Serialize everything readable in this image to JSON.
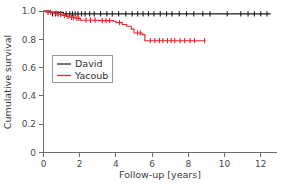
{
  "chart_data": {
    "type": "line",
    "subtype": "kaplan-meier-step",
    "title": "",
    "xlabel": "Follow-up [years]",
    "ylabel": "Cumulative survival",
    "xlim": [
      0,
      12.9
    ],
    "ylim": [
      0,
      1.0
    ],
    "xticks": [
      0,
      2,
      4,
      6,
      8,
      10,
      12
    ],
    "xtick_labels": [
      "0",
      "2",
      "4",
      "6",
      "8",
      "10",
      "12"
    ],
    "yticks": [
      0,
      0.2,
      0.4,
      0.6,
      0.8,
      1.0
    ],
    "ytick_labels": [
      "0",
      "0.2",
      "0.4",
      "0.6",
      "0.8",
      "1.0"
    ],
    "grid": false,
    "legend_position": "center-left",
    "series": [
      {
        "name": "David",
        "color": "#1a1a1a",
        "step_points": [
          [
            0.0,
            1.0
          ],
          [
            0.35,
            1.0
          ],
          [
            0.35,
            0.99
          ],
          [
            1.1,
            0.99
          ],
          [
            1.1,
            0.98
          ],
          [
            12.55,
            0.98
          ]
        ],
        "censor_times": [
          0.5,
          0.65,
          0.8,
          0.95,
          1.25,
          1.45,
          1.6,
          1.75,
          1.9,
          2.1,
          2.3,
          2.55,
          2.8,
          3.15,
          3.5,
          3.8,
          4.15,
          4.55,
          4.9,
          5.2,
          5.5,
          5.8,
          6.1,
          6.45,
          6.8,
          7.1,
          7.5,
          7.9,
          8.3,
          8.8,
          9.2,
          10.15,
          10.9,
          11.3,
          11.65,
          12.0,
          12.35
        ],
        "censor_level": 0.98
      },
      {
        "name": "Yacoub",
        "color": "#e8202a",
        "step_points": [
          [
            0.0,
            1.0
          ],
          [
            0.15,
            1.0
          ],
          [
            0.15,
            0.99
          ],
          [
            0.55,
            0.99
          ],
          [
            0.55,
            0.985
          ],
          [
            0.85,
            0.985
          ],
          [
            0.85,
            0.975
          ],
          [
            1.05,
            0.975
          ],
          [
            1.05,
            0.968
          ],
          [
            1.25,
            0.968
          ],
          [
            1.25,
            0.962
          ],
          [
            1.45,
            0.962
          ],
          [
            1.45,
            0.955
          ],
          [
            1.75,
            0.955
          ],
          [
            1.75,
            0.948
          ],
          [
            2.05,
            0.948
          ],
          [
            2.05,
            0.935
          ],
          [
            3.05,
            0.935
          ],
          [
            3.05,
            0.932
          ],
          [
            3.85,
            0.932
          ],
          [
            3.85,
            0.928
          ],
          [
            4.0,
            0.928
          ],
          [
            4.0,
            0.918
          ],
          [
            4.35,
            0.918
          ],
          [
            4.35,
            0.905
          ],
          [
            4.6,
            0.905
          ],
          [
            4.6,
            0.892
          ],
          [
            4.85,
            0.892
          ],
          [
            4.85,
            0.872
          ],
          [
            5.0,
            0.872
          ],
          [
            5.0,
            0.845
          ],
          [
            5.45,
            0.845
          ],
          [
            5.45,
            0.833
          ],
          [
            5.6,
            0.833
          ],
          [
            5.6,
            0.79
          ],
          [
            8.95,
            0.79
          ]
        ],
        "censor_times": [
          0.25,
          0.4,
          0.7,
          0.95,
          1.15,
          1.35,
          1.55,
          1.65,
          1.85,
          1.95,
          2.35,
          2.6,
          2.85,
          3.25,
          3.45,
          3.65,
          4.2,
          5.2,
          5.35,
          5.9,
          6.15,
          6.4,
          6.6,
          6.85,
          7.05,
          7.25,
          7.55,
          7.8,
          8.1,
          8.35,
          8.9
        ],
        "censor_level_note": "censor ticks lie on the current step level"
      }
    ]
  },
  "legend": {
    "entries": [
      {
        "label": "David",
        "color": "#1a1a1a"
      },
      {
        "label": "Yacoub",
        "color": "#e8202a"
      }
    ]
  },
  "axes": {
    "x_title": "Follow-up [years]",
    "y_title": "Cumulative survival",
    "x_tick_labels": [
      "0",
      "2",
      "4",
      "6",
      "8",
      "10",
      "12"
    ],
    "y_tick_labels": [
      "1.0",
      "0.8",
      "0.6",
      "0.4",
      "0.2",
      "0"
    ]
  },
  "colors": {
    "david": "#1a1a1a",
    "yacoub": "#e8202a",
    "axis": "#6b6b6b",
    "text": "#3a3a3a",
    "background": "#ffffff"
  }
}
